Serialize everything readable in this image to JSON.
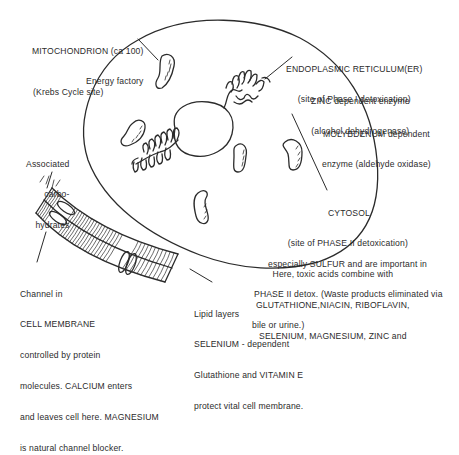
{
  "diagram": {
    "colors": {
      "ink": "#2b2b2b",
      "background": "#ffffff"
    },
    "labels": {
      "mitochondrion": [
        "MITOCHONDRION (ca 100)",
        "Energy factory"
      ],
      "krebs": [
        "(Krebs Cycle site)"
      ],
      "er": [
        "ENDOPLASMIC RETICULUM(ER)",
        "(site of Phase I detoxication)"
      ],
      "zinc": [
        "ZINC dependent enzyme",
        "(alcohol dehydrogenase)"
      ],
      "molybdenum": [
        "MOLYBDENUM dependent",
        "enzyme (aldehyde oxidase)"
      ],
      "carbohydrates": [
        "Associated",
        "carbo-",
        "hydrates"
      ],
      "cytosol": [
        "CYTOSOL",
        "(site of PHASE II detoxication)",
        "Here, toxic acids combine with",
        "GLUTATHIONE,NIACIN, RIBOFLAVIN,",
        "SELENIUM, MAGNESIUM, ZINC and",
        "especially SULFUR and are important in",
        "PHASE II detox. (Waste products eliminated via",
        "bile or urine.)"
      ],
      "channel": [
        "Channel in",
        "CELL MEMBRANE",
        "controlled by protein",
        "molecules. CALCIUM enters",
        "and leaves cell here. MAGNESIUM",
        "is natural channel blocker."
      ],
      "lipid": [
        "Lipid layers",
        "SELENIUM - dependent",
        "Glutathione and VITAMIN E",
        "protect vital cell membrane."
      ]
    }
  }
}
